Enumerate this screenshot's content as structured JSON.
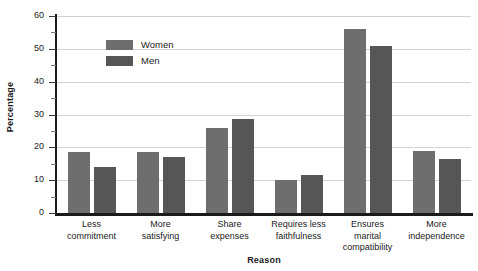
{
  "chart_data": {
    "type": "bar",
    "title": "",
    "xlabel": "Reason",
    "ylabel": "Percentage",
    "ylim": [
      0,
      60
    ],
    "yticks": [
      0,
      10,
      20,
      30,
      40,
      50,
      60
    ],
    "ytick_labels": [
      "0",
      "10",
      "20",
      "30",
      "40",
      "50",
      "60"
    ],
    "yminor_ticks": [
      5,
      15,
      25,
      35,
      45,
      55
    ],
    "grid": "horizontal",
    "legend_position": "upper-left-inside",
    "categories": [
      "Less commitment",
      "More satisfying",
      "Share expenses",
      "Requires less faithfulness",
      "Ensures marital compatibility",
      "More independence"
    ],
    "category_lines": [
      [
        "Less",
        "commitment"
      ],
      [
        "More",
        "satisfying"
      ],
      [
        "Share",
        "expenses"
      ],
      [
        "Requires less",
        "faithfulness"
      ],
      [
        "Ensures",
        "marital",
        "compatibility"
      ],
      [
        "More",
        "independence"
      ]
    ],
    "series": [
      {
        "name": "Women",
        "color": "#6e6e6e",
        "values": [
          18.5,
          18.5,
          26,
          10,
          56,
          19
        ]
      },
      {
        "name": "Men",
        "color": "#565656",
        "values": [
          14,
          17,
          28.5,
          11.5,
          51,
          16.5
        ]
      }
    ]
  },
  "legend": {
    "items": [
      {
        "label": "Women",
        "swatch": "women-swatch"
      },
      {
        "label": "Men",
        "swatch": "men-swatch"
      }
    ]
  },
  "axes": {
    "y_title": "Percentage",
    "x_title": "Reason"
  }
}
